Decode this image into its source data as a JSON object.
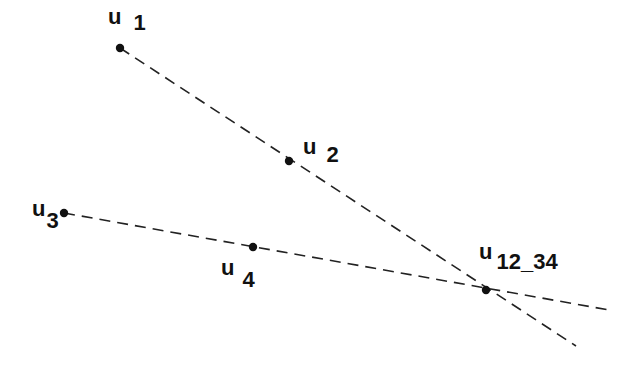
{
  "diagram": {
    "points": [
      {
        "id": "u1",
        "base": "u",
        "sub": "1",
        "x": 120,
        "y": 48,
        "label_x": 108,
        "label_y": 6,
        "sub_dx": 12,
        "sub_dy": 6
      },
      {
        "id": "u2",
        "base": "u",
        "sub": "2",
        "x": 289,
        "y": 161,
        "label_x": 303,
        "label_y": 136,
        "sub_dx": 10,
        "sub_dy": 8
      },
      {
        "id": "u3",
        "base": "u",
        "sub": "3",
        "x": 64,
        "y": 213,
        "label_x": 32,
        "label_y": 198,
        "sub_dx": 1,
        "sub_dy": 12
      },
      {
        "id": "u4",
        "base": "u",
        "sub": "4",
        "x": 253,
        "y": 247,
        "label_x": 221,
        "label_y": 257,
        "sub_dx": 8,
        "sub_dy": 12
      },
      {
        "id": "u12_34",
        "base": "u",
        "sub": "12_34",
        "x": 486,
        "y": 290,
        "label_x": 479,
        "label_y": 241,
        "sub_dx": 4,
        "sub_dy": 10
      }
    ],
    "lines": [
      {
        "name": "line-u1-u2",
        "x1": 120,
        "y1": 48,
        "x2": 576,
        "y2": 346
      },
      {
        "name": "line-u3-u4",
        "x1": 64,
        "y1": 213,
        "x2": 609,
        "y2": 310
      }
    ],
    "style": {
      "line_color": "#222222",
      "dash": "11,7",
      "stroke_width": 1.6,
      "dot_radius": 4.2
    }
  }
}
